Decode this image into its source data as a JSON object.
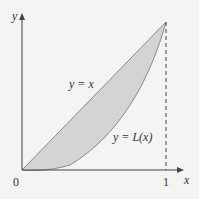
{
  "diagram": {
    "type": "lorenz-curve",
    "axes": {
      "x_label": "x",
      "y_label": "y",
      "origin_label": "0",
      "x_tick_label": "1"
    },
    "curves": [
      {
        "name": "equality-line",
        "label": "y = x"
      },
      {
        "name": "lorenz-curve",
        "label": "y = L(x)"
      }
    ],
    "colors": {
      "background": "#f4f4f2",
      "fill": "#d4d4d4",
      "curve": "#888888",
      "axis": "#444444"
    }
  }
}
